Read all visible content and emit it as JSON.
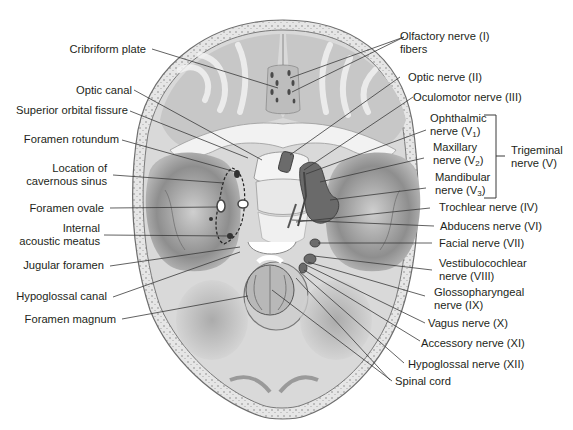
{
  "diagram": {
    "colors": {
      "bone_fill": "#dedede",
      "bone_shadow": "#9a9a9a",
      "bone_rim": "#ececec",
      "leader_line": "#3a3a3a",
      "text": "#231f20"
    },
    "left_labels": [
      {
        "id": "cribriform-plate",
        "lines": [
          "Cribriform plate"
        ]
      },
      {
        "id": "optic-canal",
        "lines": [
          "Optic canal"
        ]
      },
      {
        "id": "superior-orbital-fissure",
        "lines": [
          "Superior orbital fissure"
        ]
      },
      {
        "id": "foramen-rotundum",
        "lines": [
          "Foramen rotundum"
        ]
      },
      {
        "id": "cavernous-sinus",
        "lines": [
          "Location of",
          "cavernous sinus"
        ]
      },
      {
        "id": "foramen-ovale",
        "lines": [
          "Foramen ovale"
        ]
      },
      {
        "id": "internal-acoustic-meatus",
        "lines": [
          "Internal",
          "acoustic meatus"
        ]
      },
      {
        "id": "jugular-foramen",
        "lines": [
          "Jugular foramen"
        ]
      },
      {
        "id": "hypoglossal-canal",
        "lines": [
          "Hypoglossal canal"
        ]
      },
      {
        "id": "foramen-magnum",
        "lines": [
          "Foramen magnum"
        ]
      }
    ],
    "right_labels": [
      {
        "id": "olfactory-nerve",
        "lines": [
          "Olfactory nerve (I)",
          "fibers"
        ]
      },
      {
        "id": "optic-nerve",
        "lines": [
          "Optic nerve (II)"
        ]
      },
      {
        "id": "oculomotor-nerve",
        "lines": [
          "Oculomotor nerve (III)"
        ]
      },
      {
        "id": "ophthalmic-nerve",
        "line1": "Ophthalmic",
        "line2_pre": "nerve (V",
        "sub": "1",
        "line2_post": ")"
      },
      {
        "id": "maxillary-nerve",
        "line1": "Maxillary",
        "line2_pre": "nerve (V",
        "sub": "2",
        "line2_post": ")"
      },
      {
        "id": "mandibular-nerve",
        "line1": "Mandibular",
        "line2_pre": "nerve (V",
        "sub": "3",
        "line2_post": ")"
      },
      {
        "id": "trigeminal-nerve",
        "lines": [
          "Trigeminal",
          "nerve (V)"
        ]
      },
      {
        "id": "trochlear-nerve",
        "lines": [
          "Trochlear nerve (IV)"
        ]
      },
      {
        "id": "abducens-nerve",
        "lines": [
          "Abducens nerve (VI)"
        ]
      },
      {
        "id": "facial-nerve",
        "lines": [
          "Facial nerve (VII)"
        ]
      },
      {
        "id": "vestibulocochlear-nerve",
        "lines": [
          "Vestibulocochlear",
          "nerve (VIII)"
        ]
      },
      {
        "id": "glossopharyngeal-nerve",
        "lines": [
          "Glossopharyngeal",
          "nerve (IX)"
        ]
      },
      {
        "id": "vagus-nerve",
        "lines": [
          "Vagus nerve (X)"
        ]
      },
      {
        "id": "accessory-nerve",
        "lines": [
          "Accessory nerve (XI)"
        ]
      },
      {
        "id": "hypoglossal-nerve",
        "lines": [
          "Hypoglossal nerve (XII)"
        ]
      },
      {
        "id": "spinal-cord",
        "lines": [
          "Spinal cord"
        ]
      }
    ]
  }
}
